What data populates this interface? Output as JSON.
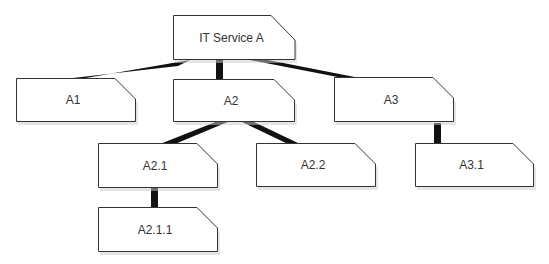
{
  "diagram": {
    "type": "hierarchy",
    "colors": {
      "box_fill": "#ffffff",
      "box_stroke": "#333333",
      "connector": "#111111",
      "text": "#333333",
      "shadow": "#bbbbbb"
    },
    "nodes": [
      {
        "id": "it-service-a",
        "label": "IT Service A",
        "parent": null
      },
      {
        "id": "a1",
        "label": "A1",
        "parent": "it-service-a"
      },
      {
        "id": "a2",
        "label": "A2",
        "parent": "it-service-a"
      },
      {
        "id": "a3",
        "label": "A3",
        "parent": "it-service-a"
      },
      {
        "id": "a2-1",
        "label": "A2.1",
        "parent": "a2"
      },
      {
        "id": "a2-2",
        "label": "A2.2",
        "parent": "a2"
      },
      {
        "id": "a3-1",
        "label": "A3.1",
        "parent": "a3"
      },
      {
        "id": "a2-1-1",
        "label": "A2.1.1",
        "parent": "a2-1"
      }
    ]
  }
}
